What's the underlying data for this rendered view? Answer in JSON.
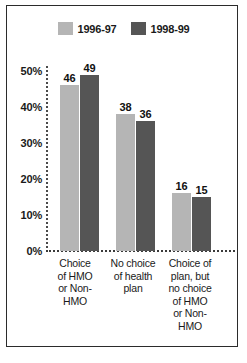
{
  "chart_data": {
    "type": "bar",
    "title": "",
    "xlabel": "",
    "ylabel": "",
    "ylim": [
      0,
      50
    ],
    "grid": false,
    "legend_position": "top-center",
    "tick_labels": [
      "0%",
      "10%",
      "20%",
      "30%",
      "40%",
      "50%"
    ],
    "tick_values": [
      0,
      10,
      20,
      30,
      40,
      50
    ],
    "categories": [
      "Choice of HMO or Non-HMO",
      "No choice of health plan",
      "Choice of plan, but no choice of HMO or Non-HMO"
    ],
    "category_lines": [
      [
        "Choice",
        "of HMO",
        "or Non-",
        "HMO"
      ],
      [
        "No choice",
        "of health",
        "plan"
      ],
      [
        "Choice of",
        "plan, but",
        "no choice",
        "of HMO",
        "or Non-",
        "HMO"
      ]
    ],
    "series": [
      {
        "name": "1996-97",
        "color": "#b5b5b5",
        "values": [
          46,
          38,
          16
        ],
        "value_labels": [
          "46",
          "38",
          "16"
        ]
      },
      {
        "name": "1998-99",
        "color": "#555555",
        "values": [
          49,
          36,
          15
        ],
        "value_labels": [
          "49",
          "36",
          "15"
        ]
      }
    ]
  },
  "legend": {
    "entries": [
      {
        "label": "1996-97",
        "color": "#b5b5b5"
      },
      {
        "label": "1998-99",
        "color": "#555555"
      }
    ]
  },
  "colors": {
    "series_light": "#b5b5b5",
    "series_dark": "#555555",
    "frame": "#2b2b2b",
    "text": "#1a1a1a",
    "background": "#ffffff"
  }
}
